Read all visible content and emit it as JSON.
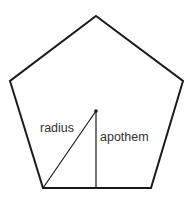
{
  "diagram": {
    "shape": "regular pentagon",
    "labels": {
      "radius": "radius",
      "apothem": "apothem"
    },
    "colors": {
      "stroke": "#1a1a1a",
      "text": "#333333",
      "background": "#ffffff"
    },
    "vertices": [
      [
        96,
        16
      ],
      [
        183,
        81
      ],
      [
        151,
        188
      ],
      [
        43,
        188
      ],
      [
        10,
        81
      ]
    ],
    "center": [
      96,
      111
    ]
  }
}
